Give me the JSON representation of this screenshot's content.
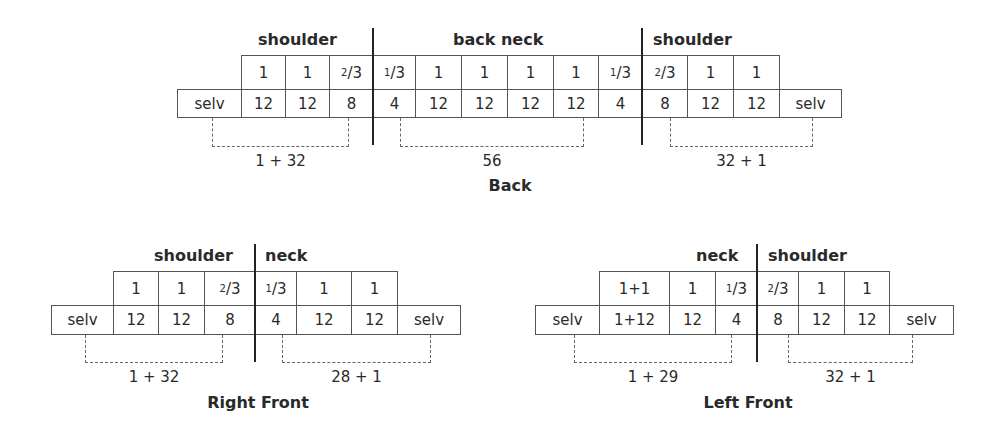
{
  "back": {
    "title": "Back",
    "headers": [
      {
        "text": "shoulder",
        "x": 258,
        "y": 30
      },
      {
        "text": "back neck",
        "x": 453,
        "y": 30
      },
      {
        "text": "shoulder",
        "x": 653,
        "y": 30
      }
    ],
    "top_row": [
      {
        "x": 241,
        "w": 44,
        "text": "1"
      },
      {
        "x": 285,
        "w": 44,
        "text": "1"
      },
      {
        "x": 329,
        "w": 44,
        "text": "2/3"
      },
      {
        "x": 373,
        "w": 42,
        "text": "1/3"
      },
      {
        "x": 415,
        "w": 46,
        "text": "1"
      },
      {
        "x": 461,
        "w": 46,
        "text": "1"
      },
      {
        "x": 507,
        "w": 46,
        "text": "1"
      },
      {
        "x": 553,
        "w": 45,
        "text": "1"
      },
      {
        "x": 598,
        "w": 44,
        "text": "1/3"
      },
      {
        "x": 642,
        "w": 45,
        "text": "2/3"
      },
      {
        "x": 687,
        "w": 46,
        "text": "1"
      },
      {
        "x": 733,
        "w": 46,
        "text": "1"
      }
    ],
    "bottom_row": [
      {
        "x": 177,
        "w": 64,
        "text": "selv"
      },
      {
        "x": 241,
        "w": 44,
        "text": "12"
      },
      {
        "x": 285,
        "w": 44,
        "text": "12"
      },
      {
        "x": 329,
        "w": 44,
        "text": "8"
      },
      {
        "x": 373,
        "w": 42,
        "text": "4"
      },
      {
        "x": 415,
        "w": 46,
        "text": "12"
      },
      {
        "x": 461,
        "w": 46,
        "text": "12"
      },
      {
        "x": 507,
        "w": 46,
        "text": "12"
      },
      {
        "x": 553,
        "w": 45,
        "text": "12"
      },
      {
        "x": 598,
        "w": 44,
        "text": "4"
      },
      {
        "x": 642,
        "w": 45,
        "text": "8"
      },
      {
        "x": 687,
        "w": 46,
        "text": "12"
      },
      {
        "x": 733,
        "w": 46,
        "text": "12"
      },
      {
        "x": 779,
        "w": 62,
        "text": "selv"
      }
    ],
    "top_y": 55,
    "mid_y": 89,
    "bot_y": 117,
    "vlines": [
      {
        "x": 372,
        "y": 28,
        "h": 117
      },
      {
        "x": 641,
        "y": 28,
        "h": 117
      }
    ],
    "brackets": [
      {
        "x1": 212,
        "x2": 349,
        "label": "1 + 32"
      },
      {
        "x1": 400,
        "x2": 584,
        "label": "56"
      },
      {
        "x1": 670,
        "x2": 813,
        "label": "32 + 1"
      }
    ],
    "bracket_bottom": 146,
    "label_y": 152,
    "title_x": 510,
    "title_y": 176
  },
  "right_front": {
    "title": "Right Front",
    "headers": [
      {
        "text": "shoulder",
        "x": 154,
        "y": 246
      },
      {
        "text": "neck",
        "x": 265,
        "y": 246
      }
    ],
    "top_row": [
      {
        "x": 113,
        "w": 45,
        "text": "1"
      },
      {
        "x": 158,
        "w": 46,
        "text": "1"
      },
      {
        "x": 204,
        "w": 51,
        "text": "2/3"
      },
      {
        "x": 255,
        "w": 41,
        "text": "1/3"
      },
      {
        "x": 296,
        "w": 55,
        "text": "1"
      },
      {
        "x": 351,
        "w": 46,
        "text": "1"
      }
    ],
    "bottom_row": [
      {
        "x": 51,
        "w": 62,
        "text": "selv"
      },
      {
        "x": 113,
        "w": 45,
        "text": "12"
      },
      {
        "x": 158,
        "w": 46,
        "text": "12"
      },
      {
        "x": 204,
        "w": 51,
        "text": "8"
      },
      {
        "x": 255,
        "w": 41,
        "text": "4"
      },
      {
        "x": 296,
        "w": 55,
        "text": "12"
      },
      {
        "x": 351,
        "w": 46,
        "text": "12"
      },
      {
        "x": 397,
        "w": 63,
        "text": "selv"
      }
    ],
    "top_y": 271,
    "mid_y": 305,
    "bot_y": 334,
    "vlines": [
      {
        "x": 254,
        "y": 244,
        "h": 118
      }
    ],
    "brackets": [
      {
        "x1": 85,
        "x2": 223,
        "label": "1 + 32"
      },
      {
        "x1": 282,
        "x2": 431,
        "label": "28 + 1"
      }
    ],
    "bracket_bottom": 362,
    "label_y": 368,
    "title_x": 258,
    "title_y": 393
  },
  "left_front": {
    "title": "Left Front",
    "headers": [
      {
        "text": "neck",
        "x": 696,
        "y": 246
      },
      {
        "text": "shoulder",
        "x": 768,
        "y": 246
      }
    ],
    "top_row": [
      {
        "x": 599,
        "w": 70,
        "text": "1+1"
      },
      {
        "x": 669,
        "w": 46,
        "text": "1"
      },
      {
        "x": 715,
        "w": 42,
        "text": "1/3"
      },
      {
        "x": 757,
        "w": 41,
        "text": "2/3"
      },
      {
        "x": 798,
        "w": 46,
        "text": "1"
      },
      {
        "x": 844,
        "w": 45,
        "text": "1"
      }
    ],
    "bottom_row": [
      {
        "x": 535,
        "w": 64,
        "text": "selv"
      },
      {
        "x": 599,
        "w": 70,
        "text": "1+12"
      },
      {
        "x": 669,
        "w": 46,
        "text": "12"
      },
      {
        "x": 715,
        "w": 42,
        "text": "4"
      },
      {
        "x": 757,
        "w": 41,
        "text": "8"
      },
      {
        "x": 798,
        "w": 46,
        "text": "12"
      },
      {
        "x": 844,
        "w": 45,
        "text": "12"
      },
      {
        "x": 889,
        "w": 64,
        "text": "selv"
      }
    ],
    "top_y": 271,
    "mid_y": 305,
    "bot_y": 334,
    "vlines": [
      {
        "x": 756,
        "y": 244,
        "h": 118
      }
    ],
    "brackets": [
      {
        "x1": 574,
        "x2": 732,
        "label": "1 + 29"
      },
      {
        "x1": 788,
        "x2": 913,
        "label": "32 + 1"
      }
    ],
    "bracket_bottom": 362,
    "label_y": 368,
    "title_x": 748,
    "title_y": 393
  }
}
